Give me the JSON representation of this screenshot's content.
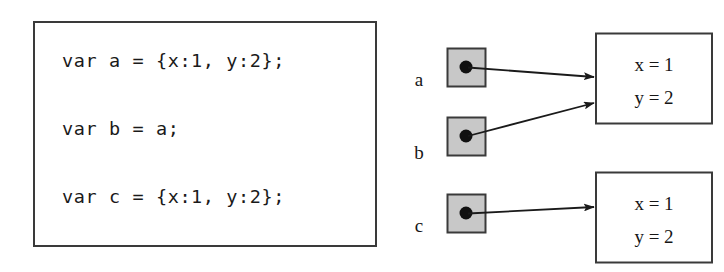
{
  "code_panel": {
    "lines": [
      "var a = {x:1, y:2};",
      "var b = a;",
      "var c = {x:1, y:2};"
    ]
  },
  "diagram": {
    "variables": [
      {
        "label": "a",
        "name": "variable-a"
      },
      {
        "label": "b",
        "name": "variable-b"
      },
      {
        "label": "c",
        "name": "variable-c"
      }
    ],
    "objects": [
      {
        "name": "object-box-1",
        "properties": [
          {
            "text": "x = 1"
          },
          {
            "text": "y = 2"
          }
        ]
      },
      {
        "name": "object-box-2",
        "properties": [
          {
            "text": "x = 1"
          },
          {
            "text": "y = 2"
          }
        ]
      }
    ],
    "references": [
      {
        "from": "a",
        "to": "object-box-1"
      },
      {
        "from": "b",
        "to": "object-box-1"
      },
      {
        "from": "c",
        "to": "object-box-2"
      }
    ]
  },
  "colors": {
    "page_background": "#ffffff",
    "stroke": "#3a3a3a",
    "ink": "#161616",
    "variable_cell_fill": "#c8c8c8",
    "pointer_dot": "#111111"
  }
}
